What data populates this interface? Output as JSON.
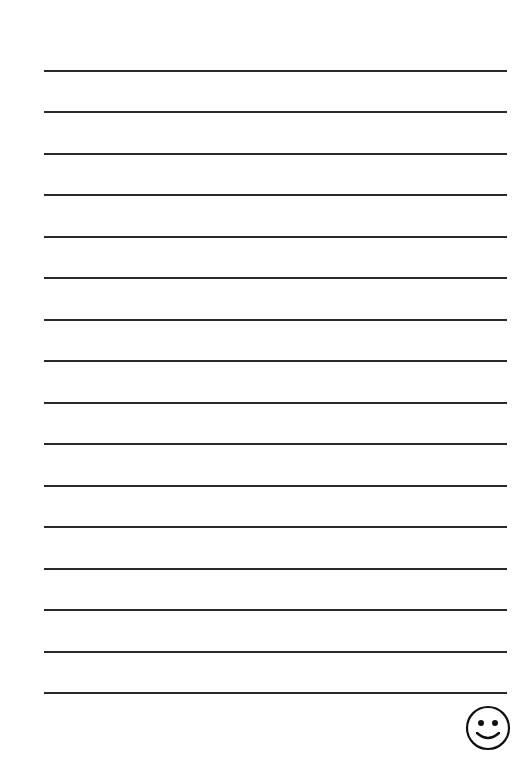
{
  "page": {
    "type": "lined-writing-paper",
    "line_count": 16,
    "line_color": "#2a2a2a",
    "background": "#ffffff",
    "lines_y": [
      70,
      111,
      153,
      194,
      236,
      277,
      319,
      360,
      402,
      443,
      485,
      526,
      568,
      609,
      651,
      692
    ],
    "corner_icon": "smiley-face-icon"
  }
}
